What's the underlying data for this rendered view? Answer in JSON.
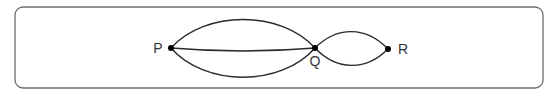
{
  "diagram": {
    "type": "multigraph",
    "frame": {
      "x": 15,
      "y": 7,
      "width": 528,
      "height": 81,
      "radius": 8,
      "stroke": "#6e6e6e"
    },
    "nodes": [
      {
        "id": "P",
        "label": "P",
        "x": 171,
        "y": 48,
        "label_x": 158,
        "label_y": 53,
        "label_anchor": "middle"
      },
      {
        "id": "Q",
        "label": "Q",
        "x": 315,
        "y": 48,
        "label_x": 315,
        "label_y": 66,
        "label_anchor": "middle"
      },
      {
        "id": "R",
        "label": "R",
        "x": 388,
        "y": 49,
        "label_x": 398,
        "label_y": 54,
        "label_anchor": "start"
      }
    ],
    "edges": [
      {
        "from": "P",
        "to": "Q",
        "shape": "upper-arc",
        "path": "M171,48 C205,10 281,10 315,48"
      },
      {
        "from": "P",
        "to": "Q",
        "shape": "straight",
        "path": "M171,48 Q243,54 315,48"
      },
      {
        "from": "P",
        "to": "Q",
        "shape": "lower-arc",
        "path": "M171,48 C205,87 281,87 315,48"
      },
      {
        "from": "Q",
        "to": "R",
        "shape": "upper-arc",
        "path": "M315,48 C337,26 366,26 388,49"
      },
      {
        "from": "Q",
        "to": "R",
        "shape": "lower-arc",
        "path": "M315,48 C337,71 366,71 388,49"
      }
    ],
    "edge_count": 5,
    "colors": {
      "edge": "#2a2a2a",
      "node": "#000000",
      "label": "#333333"
    }
  }
}
